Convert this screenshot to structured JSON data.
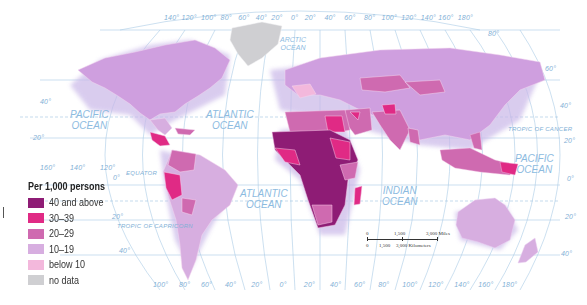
{
  "legend": {
    "title": "Per 1,000 persons",
    "items": [
      {
        "label": "40 and above",
        "color": "#8e1c75"
      },
      {
        "label": "30–39",
        "color": "#e02a85"
      },
      {
        "label": "20–29",
        "color": "#cf6ab0"
      },
      {
        "label": "10–19",
        "color": "#d7aee0"
      },
      {
        "label": "below 10",
        "color": "#f3b8dc"
      },
      {
        "label": "no data",
        "color": "#cfcfd2"
      }
    ]
  },
  "oceans": {
    "pacific_west": "Pacific\nOcean",
    "atlantic_north": "Atlantic\nOcean",
    "arctic": "Arctic\nOcean",
    "atlantic_south": "Atlantic\nOcean",
    "indian": "Indian\nOcean",
    "pacific_east": "Pacific\nOcean"
  },
  "lines": {
    "equator": "EQUATOR",
    "tropic_cancer": "TROPIC OF CANCER",
    "tropic_capricorn": "TROPIC OF CAPRICORN"
  },
  "top_longitudes": [
    "140°",
    "120°",
    "100°",
    "80°",
    "60°",
    "40°",
    "20°",
    "0°",
    "20°",
    "40°",
    "60°",
    "80°",
    "100°",
    "120°",
    "140°",
    "160°",
    "180°"
  ],
  "bottom_longitudes": [
    "100°",
    "80°",
    "60°",
    "40°",
    "20°",
    "0°",
    "20°",
    "40°",
    "60°",
    "80°",
    "100°",
    "120°",
    "140°",
    "160°",
    "180°"
  ],
  "left_longitudes": [
    "160°",
    "140°",
    "120°"
  ],
  "latitudes": {
    "left_40": "40°",
    "left_20": "20°",
    "left_0": "0°",
    "left_s20": "20°",
    "left_s40": "40°",
    "right_60": "60°",
    "right_40": "40°",
    "right_20": "20°",
    "right_0": "0°",
    "right_s20": "20°",
    "right_s40": "40°",
    "top_80": "80°"
  },
  "scale_bar": {
    "miles": {
      "zero": "0",
      "mid": "1,500",
      "end": "3,000 Miles"
    },
    "km": {
      "zero": "0",
      "mid": "1,500",
      "end": "3,000 Kilometers"
    }
  }
}
